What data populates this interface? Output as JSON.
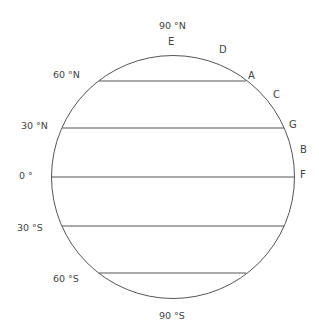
{
  "diagram": {
    "title": "",
    "colors": {
      "stroke": "#555555",
      "text": "#444444",
      "background": "#ffffff"
    },
    "latitude_labels": {
      "n90": "90 °N",
      "n60": "60 °N",
      "n30": "30 °N",
      "eq": "0 °",
      "s30": "30 °S",
      "s60": "60 °S",
      "s90": "90 °S"
    },
    "points": {
      "A": "A",
      "B": "B",
      "C": "C",
      "D": "D",
      "E": "E",
      "F": "F",
      "G": "G"
    }
  }
}
